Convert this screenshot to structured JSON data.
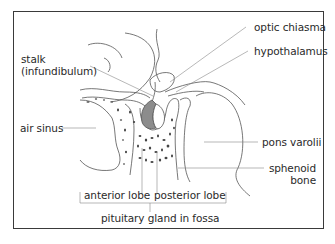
{
  "diagram": {
    "colors": {
      "frame": "#3a3a3a",
      "lines": "#555555",
      "leader": "#888888",
      "posterior_lobe_fill": "#8c8c8c",
      "text": "#2a2a2a"
    },
    "labels": {
      "stalk": "stalk",
      "stalk_sub": "(infundibulum)",
      "optic_chiasma": "optic chiasma",
      "hypothalamus": "hypothalamus",
      "air_sinus": "air sinus",
      "pons_varolii": "pons varolii",
      "sphenoid": "sphenoid",
      "bone": "bone",
      "anterior_lobe": "anterior lobe",
      "posterior_lobe": "posterior lobe",
      "pituitary_gland": "pituitary gland in fossa"
    }
  }
}
